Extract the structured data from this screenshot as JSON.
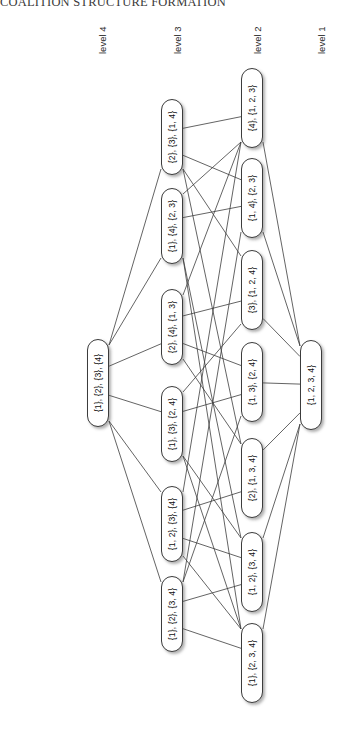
{
  "figure": {
    "title": "COALITION STRUCTURE FORMATION",
    "orientation": "rotated-90-ccw",
    "background_color": "#ffffff",
    "node_fill": "#ffffff",
    "node_border": "#3c3c3c",
    "edge_color": "#3c3c3c"
  },
  "levels": [
    {
      "id": "level4",
      "label": "level 4",
      "label_x": 97,
      "label_y": 54,
      "column_x": 98
    },
    {
      "id": "level3",
      "label": "level 3",
      "label_x": 172,
      "label_y": 54,
      "column_x": 172
    },
    {
      "id": "level2",
      "label": "level 2",
      "label_x": 252,
      "label_y": 54,
      "column_x": 252
    },
    {
      "id": "level1",
      "label": "level 1",
      "label_x": 316,
      "label_y": 54,
      "column_x": 311
    }
  ],
  "nodes": [
    {
      "id": "n4_1",
      "level": 4,
      "label": "{1}, {2}, {3}, {4}",
      "x": 98,
      "y": 383,
      "w": 22,
      "h": 88
    },
    {
      "id": "n3_1",
      "level": 3,
      "label": "{2}, {3}, {1, 4}",
      "x": 172,
      "y": 137,
      "w": 22,
      "h": 76
    },
    {
      "id": "n3_2",
      "level": 3,
      "label": "{1}, {4}, {2, 3}",
      "x": 172,
      "y": 226,
      "w": 22,
      "h": 76
    },
    {
      "id": "n3_3",
      "level": 3,
      "label": "{2}, {4}, {1, 3}",
      "x": 172,
      "y": 327,
      "w": 22,
      "h": 76
    },
    {
      "id": "n3_4",
      "level": 3,
      "label": "{1}, {3}, {2, 4}",
      "x": 172,
      "y": 424,
      "w": 22,
      "h": 76
    },
    {
      "id": "n3_5",
      "level": 3,
      "label": "{1, 2}, {3}, {4}",
      "x": 172,
      "y": 524,
      "w": 22,
      "h": 76
    },
    {
      "id": "n3_6",
      "level": 3,
      "label": "{1}, {2}, {3, 4}",
      "x": 172,
      "y": 614,
      "w": 22,
      "h": 76
    },
    {
      "id": "n2_1",
      "level": 2,
      "label": "{4}, {1, 2, 3}",
      "x": 252,
      "y": 108,
      "w": 22,
      "h": 80
    },
    {
      "id": "n2_2",
      "level": 2,
      "label": "{1, 4}, {2, 3}",
      "x": 252,
      "y": 198,
      "w": 22,
      "h": 80
    },
    {
      "id": "n2_3",
      "level": 2,
      "label": "{3}, {1, 2, 4}",
      "x": 252,
      "y": 290,
      "w": 22,
      "h": 80
    },
    {
      "id": "n2_4",
      "level": 2,
      "label": "{1, 3}, {2, 4}",
      "x": 252,
      "y": 382,
      "w": 22,
      "h": 80
    },
    {
      "id": "n2_5",
      "level": 2,
      "label": "{2}, {1, 3, 4}",
      "x": 252,
      "y": 478,
      "w": 22,
      "h": 80
    },
    {
      "id": "n2_6",
      "level": 2,
      "label": "{1, 2}, {3, 4}",
      "x": 252,
      "y": 572,
      "w": 22,
      "h": 80
    },
    {
      "id": "n2_7",
      "level": 2,
      "label": "{1}, {2, 3, 4}",
      "x": 252,
      "y": 663,
      "w": 22,
      "h": 80
    },
    {
      "id": "n1_1",
      "level": 1,
      "label": "{1, 2, 3, 4}",
      "x": 311,
      "y": 385,
      "w": 22,
      "h": 90
    }
  ],
  "edges": [
    {
      "from": "n4_1",
      "to": "n3_1"
    },
    {
      "from": "n4_1",
      "to": "n3_2"
    },
    {
      "from": "n4_1",
      "to": "n3_3"
    },
    {
      "from": "n4_1",
      "to": "n3_4"
    },
    {
      "from": "n4_1",
      "to": "n3_5"
    },
    {
      "from": "n4_1",
      "to": "n3_6"
    },
    {
      "from": "n3_1",
      "to": "n2_1"
    },
    {
      "from": "n3_1",
      "to": "n2_2"
    },
    {
      "from": "n3_1",
      "to": "n2_3"
    },
    {
      "from": "n3_1",
      "to": "n2_5"
    },
    {
      "from": "n3_2",
      "to": "n2_1"
    },
    {
      "from": "n3_2",
      "to": "n2_2"
    },
    {
      "from": "n3_2",
      "to": "n2_6"
    },
    {
      "from": "n3_2",
      "to": "n2_7"
    },
    {
      "from": "n3_3",
      "to": "n2_1"
    },
    {
      "from": "n3_3",
      "to": "n2_3"
    },
    {
      "from": "n3_3",
      "to": "n2_4"
    },
    {
      "from": "n3_3",
      "to": "n2_5"
    },
    {
      "from": "n3_4",
      "to": "n2_3"
    },
    {
      "from": "n3_4",
      "to": "n2_4"
    },
    {
      "from": "n3_4",
      "to": "n2_6"
    },
    {
      "from": "n3_4",
      "to": "n2_7"
    },
    {
      "from": "n3_5",
      "to": "n2_1"
    },
    {
      "from": "n3_5",
      "to": "n2_5"
    },
    {
      "from": "n3_5",
      "to": "n2_6"
    },
    {
      "from": "n3_5",
      "to": "n2_7"
    },
    {
      "from": "n3_6",
      "to": "n2_2"
    },
    {
      "from": "n3_6",
      "to": "n2_4"
    },
    {
      "from": "n3_6",
      "to": "n2_6"
    },
    {
      "from": "n3_6",
      "to": "n2_7"
    },
    {
      "from": "n2_1",
      "to": "n1_1"
    },
    {
      "from": "n2_2",
      "to": "n1_1"
    },
    {
      "from": "n2_3",
      "to": "n1_1"
    },
    {
      "from": "n2_4",
      "to": "n1_1"
    },
    {
      "from": "n2_5",
      "to": "n1_1"
    },
    {
      "from": "n2_6",
      "to": "n1_1"
    },
    {
      "from": "n2_7",
      "to": "n1_1"
    }
  ]
}
